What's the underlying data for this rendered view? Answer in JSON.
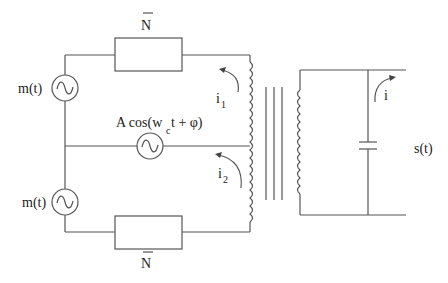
{
  "diagram": {
    "type": "circuit",
    "labels": {
      "resistor_top": "N",
      "resistor_bottom": "N",
      "source_top": "m(t)",
      "source_bottom": "m(t)",
      "carrier_prefix": "A cos(w",
      "carrier_sub": "c",
      "carrier_suffix": " t + φ)",
      "current_top": "i",
      "current_top_sub": "1",
      "current_bottom": "i",
      "current_bottom_sub": "2",
      "current_secondary": "i",
      "output": "s(t)"
    },
    "components": [
      {
        "id": "R1",
        "kind": "impedance",
        "label": "N̄"
      },
      {
        "id": "R2",
        "kind": "impedance",
        "label": "N̄"
      },
      {
        "id": "V1",
        "kind": "ac-source",
        "label": "m(t)"
      },
      {
        "id": "V2",
        "kind": "ac-source",
        "label": "m(t)"
      },
      {
        "id": "Vc",
        "kind": "ac-source",
        "label": "A cos(w_c t + φ)"
      },
      {
        "id": "T1",
        "kind": "transformer",
        "label": ""
      },
      {
        "id": "C1",
        "kind": "capacitor",
        "label": ""
      }
    ],
    "colors": {
      "wire": "#555555",
      "text": "#222222",
      "background": "#ffffff"
    }
  }
}
